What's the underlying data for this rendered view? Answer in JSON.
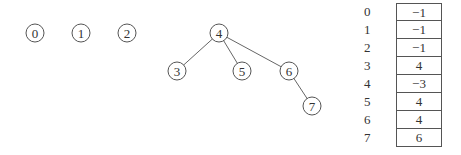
{
  "diagram": {
    "nodes": [
      {
        "id": "0",
        "label": "0",
        "x": 35,
        "y": 33
      },
      {
        "id": "1",
        "label": "1",
        "x": 81,
        "y": 33
      },
      {
        "id": "2",
        "label": "2",
        "x": 127,
        "y": 33
      },
      {
        "id": "4",
        "label": "4",
        "x": 219,
        "y": 33
      },
      {
        "id": "3",
        "label": "3",
        "x": 177,
        "y": 71
      },
      {
        "id": "5",
        "label": "5",
        "x": 242,
        "y": 71
      },
      {
        "id": "6",
        "label": "6",
        "x": 289,
        "y": 71
      },
      {
        "id": "7",
        "label": "7",
        "x": 312,
        "y": 106
      }
    ],
    "edges": [
      {
        "from": "4",
        "to": "3"
      },
      {
        "from": "4",
        "to": "5"
      },
      {
        "from": "4",
        "to": "6"
      },
      {
        "from": "6",
        "to": "7"
      }
    ]
  },
  "table": {
    "rows": [
      {
        "index": "0",
        "value": "−1"
      },
      {
        "index": "1",
        "value": "−1"
      },
      {
        "index": "2",
        "value": "−1"
      },
      {
        "index": "3",
        "value": "4"
      },
      {
        "index": "4",
        "value": "−3"
      },
      {
        "index": "5",
        "value": "4"
      },
      {
        "index": "6",
        "value": "4"
      },
      {
        "index": "7",
        "value": "6"
      }
    ]
  }
}
